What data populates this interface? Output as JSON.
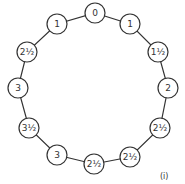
{
  "diagram": {
    "type": "ring-of-nodes",
    "nodes": [
      {
        "label": "0"
      },
      {
        "label": "1"
      },
      {
        "label": "1½"
      },
      {
        "label": "2"
      },
      {
        "label": "2½"
      },
      {
        "label": "2½"
      },
      {
        "label": "2½"
      },
      {
        "label": "3"
      },
      {
        "label": "3½"
      },
      {
        "label": "3"
      },
      {
        "label": "2½"
      },
      {
        "label": "1"
      }
    ],
    "caption": "(i)"
  }
}
